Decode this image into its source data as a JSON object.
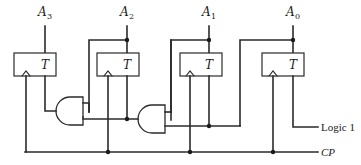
{
  "diagram": {
    "type": "4-bit synchronous binary counter with T flip-flops",
    "flip_flops": [
      {
        "id": "FF3",
        "output": {
          "letter": "A",
          "index": "3"
        },
        "input_label": "T"
      },
      {
        "id": "FF2",
        "output": {
          "letter": "A",
          "index": "2"
        },
        "input_label": "T"
      },
      {
        "id": "FF1",
        "output": {
          "letter": "A",
          "index": "1"
        },
        "input_label": "T"
      },
      {
        "id": "FF0",
        "output": {
          "letter": "A",
          "index": "0"
        },
        "input_label": "T"
      }
    ],
    "gates": [
      {
        "id": "AND1",
        "type": "AND"
      },
      {
        "id": "AND2",
        "type": "AND"
      }
    ],
    "inputs": {
      "logic1": "Logic 1",
      "clock": "CP"
    }
  }
}
